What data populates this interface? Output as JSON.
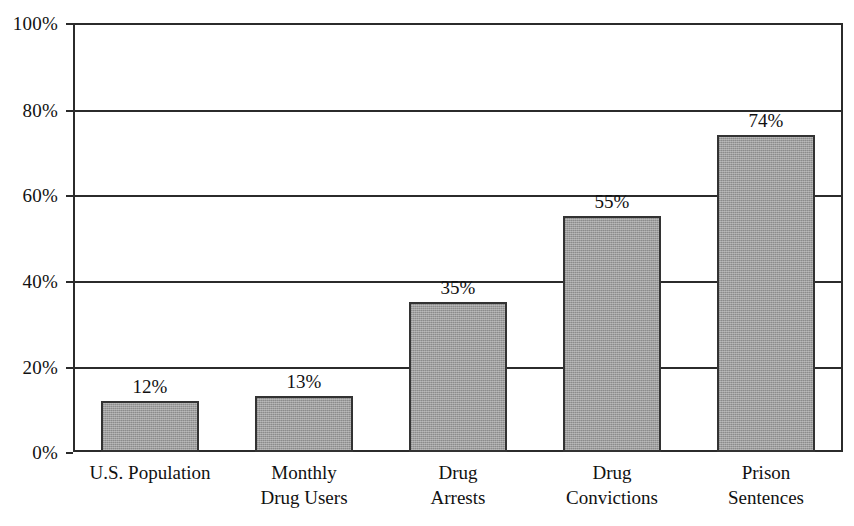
{
  "chart_data": {
    "type": "bar",
    "title": "",
    "subtitle": "",
    "xlabel": "",
    "ylabel": "",
    "ylim": [
      0,
      100
    ],
    "y_unit": "%",
    "grid": true,
    "legend": "none",
    "orientation": "vertical",
    "categories": [
      "U.S. Population",
      "Monthly Drug Users",
      "Drug Arrests",
      "Drug Convictions",
      "Prison Sentences"
    ],
    "category_lines": [
      [
        "U.S. Population"
      ],
      [
        "Monthly",
        "Drug Users"
      ],
      [
        "Drug",
        "Arrests"
      ],
      [
        "Drug",
        "Convictions"
      ],
      [
        "Prison",
        "Sentences"
      ]
    ],
    "values": [
      12,
      13,
      35,
      55,
      74
    ],
    "data_labels": [
      "12%",
      "13%",
      "35%",
      "55%",
      "74%"
    ],
    "y_ticks": [
      0,
      20,
      40,
      60,
      80,
      100
    ],
    "y_tick_labels": [
      "0%",
      "20%",
      "40%",
      "60%",
      "80%",
      "100%"
    ],
    "colors": {
      "bar_fill": "#9e9e9e",
      "bar_border": "#333333",
      "gridline": "#2b2b2b",
      "axis": "#2b2b2b",
      "background": "#ffffff",
      "text": "#111111"
    }
  }
}
